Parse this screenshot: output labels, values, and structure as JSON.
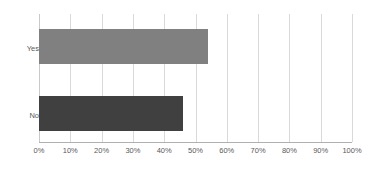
{
  "chart_data": {
    "type": "bar",
    "orientation": "horizontal",
    "title": "",
    "subtitle": "",
    "xlabel": "",
    "ylabel": "",
    "categories": [
      "Yes",
      "No"
    ],
    "values": [
      54,
      46
    ],
    "value_suffix": "%",
    "xlim": [
      0,
      100
    ],
    "xticks": [
      0,
      10,
      20,
      30,
      40,
      50,
      60,
      70,
      80,
      90,
      100
    ],
    "xtick_labels": [
      "0%",
      "10%",
      "20%",
      "30%",
      "40%",
      "50%",
      "60%",
      "70%",
      "80%",
      "90%",
      "100%"
    ],
    "grid": true,
    "grid_axis": "x",
    "legend": false,
    "legend_position": "none",
    "data_labels": false,
    "bar_colors": [
      "#808080",
      "#404040"
    ],
    "series": [
      {
        "name": "Yes",
        "value": 54,
        "color": "#808080"
      },
      {
        "name": "No",
        "value": 46,
        "color": "#404040"
      }
    ]
  },
  "colors": {
    "background": "#ffffff",
    "gridline": "#d9d9d9",
    "axis_line": "#b0b0b0",
    "tick_text": "#595959",
    "category_text": "#595959",
    "bar_yes": "#808080",
    "bar_no": "#404040"
  }
}
